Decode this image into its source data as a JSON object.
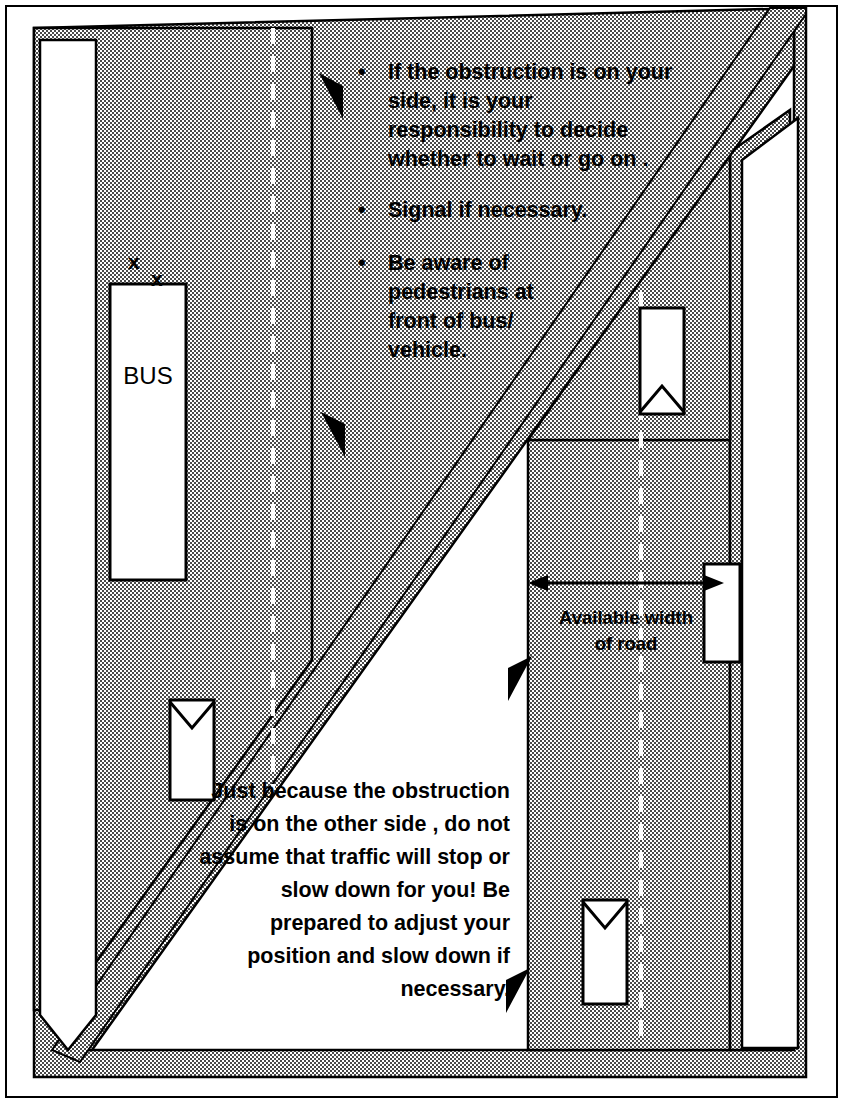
{
  "diagram": {
    "colors": {
      "road_fill": "#b9b9b9",
      "band_fill": "#c9c9c9",
      "ink": "#000000",
      "paper": "#ffffff"
    },
    "bullets": [
      {
        "marker": "•",
        "text": " If the obstruction is on your side, it is your responsibility to decide whether to wait or go on ."
      },
      {
        "marker": "•",
        "text": "Signal if necessary."
      },
      {
        "marker": "•",
        "text": "Be aware of pedestrians at front of bus/ vehicle."
      }
    ],
    "bottom_paragraph": "Just because the obstruction is on the other side , do not assume that traffic will stop or slow down for you! Be prepared to adjust your position and slow down if necessary.",
    "available_width_label": "Available width of road",
    "bus_label": "BUS",
    "pedestrian_marks": [
      "x",
      "x"
    ],
    "icons": {
      "pointer_left": "left-pointer-triangle-icon",
      "pointer_right": "right-pointer-triangle-icon",
      "dimension_arrow": "double-headed-arrow-icon",
      "vehicle": "vehicle-plan-icon",
      "bus": "bus-plan-icon",
      "lane_divider": "dashed-lane-line-icon"
    }
  }
}
